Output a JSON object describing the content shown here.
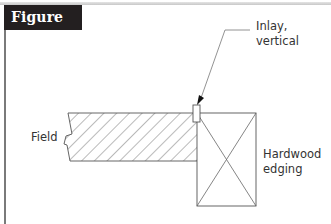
{
  "figure": {
    "title": "Figure 5.04",
    "title_bg": "#231f20",
    "title_color": "#ffffff"
  },
  "labels": {
    "inlay_line1": "Inlay,",
    "inlay_line2": "vertical",
    "field": "Field",
    "edging_line1": "Hardwood",
    "edging_line2": "edging"
  },
  "colors": {
    "line": "#555555",
    "hatch": "#666666",
    "text": "#333333"
  }
}
